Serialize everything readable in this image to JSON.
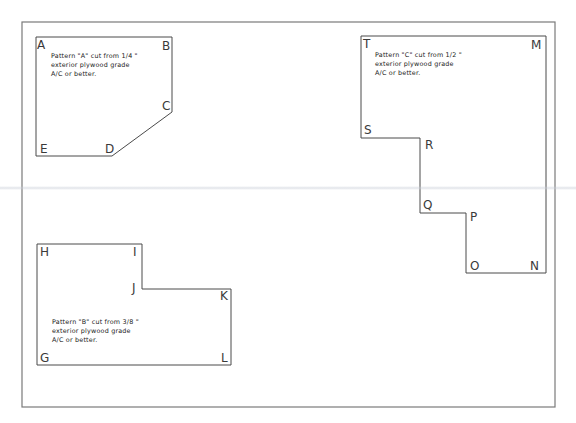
{
  "drawing": {
    "border": {
      "x": 22,
      "y": 22,
      "w": 533,
      "h": 385
    },
    "colors": {
      "line": "#4a4a4a",
      "border": "#7a7a7a",
      "text": "#222222",
      "background": "#ffffff"
    },
    "patterns": [
      {
        "id": "A",
        "name": "Pattern A",
        "vertices": [
          {
            "label": "A",
            "x": 36,
            "y": 37
          },
          {
            "label": "B",
            "x": 172,
            "y": 37
          },
          {
            "label": "C",
            "x": 172,
            "y": 112
          },
          {
            "label": "D",
            "x": 112,
            "y": 156
          },
          {
            "label": "E",
            "x": 36,
            "y": 156
          }
        ],
        "note": {
          "line1": "Pattern \"A\" cut from 1/4 \"",
          "line2": "exterior plywood grade",
          "line3": "A/C or better."
        }
      },
      {
        "id": "B",
        "name": "Pattern B",
        "vertices": [
          {
            "label": "H",
            "x": 37,
            "y": 244
          },
          {
            "label": "I",
            "x": 142,
            "y": 244
          },
          {
            "label": "J",
            "x": 142,
            "y": 289
          },
          {
            "label": "K",
            "x": 231,
            "y": 289
          },
          {
            "label": "L",
            "x": 231,
            "y": 365
          },
          {
            "label": "G",
            "x": 37,
            "y": 365
          }
        ],
        "note": {
          "line1": "Pattern \"B\" cut from 3/8 \"",
          "line2": "exterior plywood grade",
          "line3": "A/C or better."
        }
      },
      {
        "id": "C",
        "name": "Pattern C",
        "vertices": [
          {
            "label": "T",
            "x": 361,
            "y": 36
          },
          {
            "label": "M",
            "x": 546,
            "y": 36
          },
          {
            "label": "N",
            "x": 546,
            "y": 273
          },
          {
            "label": "O",
            "x": 466,
            "y": 273
          },
          {
            "label": "P",
            "x": 466,
            "y": 213
          },
          {
            "label": "Q",
            "x": 420,
            "y": 213
          },
          {
            "label": "R",
            "x": 420,
            "y": 138
          },
          {
            "label": "S",
            "x": 361,
            "y": 138
          }
        ],
        "note": {
          "line1": "Pattern \"C\" cut from 1/2 \"",
          "line2": "exterior plywood grade",
          "line3": "A/C or better."
        }
      }
    ]
  }
}
